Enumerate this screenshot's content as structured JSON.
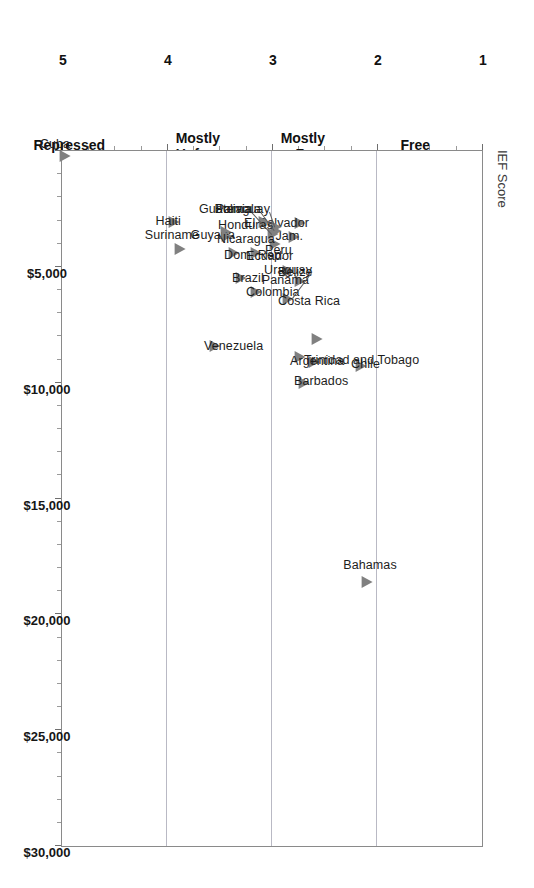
{
  "chart": {
    "value_axis_label": "IEF Score",
    "orientation_note": "rotated-90-clockwise"
  },
  "ief_axis": {
    "numbers": [
      "1",
      "2",
      "3",
      "4",
      "5"
    ],
    "categories": [
      {
        "label": "Free",
        "at": 1.5
      },
      {
        "label": "Mostly\nFree",
        "at": 2.5
      },
      {
        "label": "Mostly\nUnfree",
        "at": 3.5
      },
      {
        "label": "Repressed",
        "at": 4.6
      }
    ]
  },
  "gdp_axis": {
    "ticks": [
      "$5,000",
      "$10,000",
      "$15,000",
      "$20,000",
      "$25,000",
      "$30,000"
    ]
  },
  "chart_data": {
    "type": "scatter",
    "title": "",
    "xlabel": "",
    "ylabel": "IEF Score",
    "xlim": [
      0,
      30000
    ],
    "ylim": [
      1,
      5
    ],
    "y_inverted": true,
    "grid": "y-gridlines at 2, 3, 4",
    "legend": "none",
    "marker": "left-pointing gray triangle",
    "marker_color": "#808080",
    "points": [
      {
        "name": "Bahamas",
        "gdp": 18600,
        "ief": 2.1
      },
      {
        "name": "Chile",
        "gdp": 9300,
        "ief": 2.16
      },
      {
        "name": "Uruguay",
        "gdp": 8100,
        "ief": 2.58
      },
      {
        "name": "Trinidad and Tobago",
        "gdp": 9100,
        "ief": 2.61
      },
      {
        "name": "Argentina",
        "gdp": 8900,
        "ief": 2.74
      },
      {
        "name": "Barbados",
        "gdp": 10000,
        "ief": 2.7
      },
      {
        "name": "Panama",
        "gdp": 5600,
        "ief": 2.74
      },
      {
        "name": "Belize",
        "gdp": 5200,
        "ief": 2.86
      },
      {
        "name": "Costa Rica",
        "gdp": 6400,
        "ief": 2.86
      },
      {
        "name": "El Salvador",
        "gdp": 3100,
        "ief": 2.74
      },
      {
        "name": "Jam.",
        "gdp": 3700,
        "ief": 2.8
      },
      {
        "name": "Paraguay",
        "gdp": 3300,
        "ief": 2.97
      },
      {
        "name": "Guatemala",
        "gdp": 3450,
        "ief": 2.97
      },
      {
        "name": "Bolivia",
        "gdp": 3600,
        "ief": 3.0
      },
      {
        "name": "Peru",
        "gdp": 4000,
        "ief": 2.98
      },
      {
        "name": "Honduras",
        "gdp": 3050,
        "ief": 3.09
      },
      {
        "name": "Ecuador",
        "gdp": 4400,
        "ief": 3.16
      },
      {
        "name": "Colombia",
        "gdp": 6100,
        "ief": 3.16
      },
      {
        "name": "Brazil",
        "gdp": 5500,
        "ief": 3.3
      },
      {
        "name": "Dom. Rep.",
        "gdp": 4400,
        "ief": 3.37
      },
      {
        "name": "Guyana",
        "gdp": 3500,
        "ief": 3.45
      },
      {
        "name": "Nicaragua",
        "gdp": 3650,
        "ief": 3.44
      },
      {
        "name": "Venezuela",
        "gdp": 8400,
        "ief": 3.55
      },
      {
        "name": "Haiti",
        "gdp": 3050,
        "ief": 3.94
      },
      {
        "name": "Suriname",
        "gdp": 4250,
        "ief": 3.89
      },
      {
        "name": "Cuba",
        "gdp": 200,
        "ief": 4.98
      }
    ],
    "label_offsets": {
      "Bahamas": {
        "dx": -4,
        "dy": -17,
        "side": "above"
      },
      "Chile": {
        "dx": 9,
        "dy": -2,
        "side": "right"
      },
      "Uraguay": {
        "dx": 0,
        "dy": 0,
        "side": "leader"
      },
      "Trinidad and Tobago": {
        "dx": 9,
        "dy": -2,
        "side": "right"
      },
      "Argentina": {
        "dx": 9,
        "dy": 4,
        "side": "right"
      },
      "Barbados": {
        "dx": 9,
        "dy": -2,
        "side": "right"
      },
      "Panama": {
        "dx": -10,
        "dy": -1,
        "side": "left"
      },
      "Belize": {
        "dx": 9,
        "dy": 1,
        "side": "right"
      },
      "Costa Rica": {
        "dx": 9,
        "dy": 2,
        "side": "right"
      },
      "El Salvador": {
        "dx": -10,
        "dy": 0,
        "side": "left"
      },
      "Jam.": {
        "dx": -10,
        "dy": -1,
        "side": "left"
      },
      "Peru": {
        "dx": 9,
        "dy": 6,
        "side": "right"
      },
      "Honduras": {
        "dx": -10,
        "dy": 3,
        "side": "left"
      },
      "Ecuador": {
        "dx": 9,
        "dy": 3,
        "side": "right"
      },
      "Colombia": {
        "dx": 9,
        "dy": 0,
        "side": "right"
      },
      "Brazil": {
        "dx": 8,
        "dy": 0,
        "side": "right"
      },
      "Dom. Rep.": {
        "dx": 9,
        "dy": 2,
        "side": "right"
      },
      "Guyana": {
        "dx": -10,
        "dy": 3,
        "side": "left"
      },
      "Nicaragua": {
        "dx": 9,
        "dy": 3,
        "side": "right"
      },
      "Venezuela": {
        "dx": 10,
        "dy": 0,
        "side": "right"
      },
      "Haiti": {
        "dx": -8,
        "dy": -1,
        "side": "left"
      },
      "Suriname": {
        "dx": 7,
        "dy": -14,
        "side": "above"
      },
      "Cuba": {
        "dx": 9,
        "dy": -12,
        "side": "above"
      }
    },
    "leader_labels": [
      {
        "name": "Uraguay",
        "gdp": 5250,
        "ief": 2.62,
        "anchor_gdp": 6350,
        "anchor_ief": 2.8
      },
      {
        "name": "Paraguay",
        "gdp": 2650,
        "ief": 3.02,
        "anchor_gdp": 3300,
        "anchor_ief": 2.97
      },
      {
        "name": "Guatemala",
        "gdp": 2650,
        "ief": 3.1,
        "anchor_gdp": 3450,
        "anchor_ief": 2.97
      },
      {
        "name": "Bolivia",
        "gdp": 2650,
        "ief": 3.19,
        "anchor_gdp": 3600,
        "anchor_ief": 3.0
      }
    ]
  }
}
